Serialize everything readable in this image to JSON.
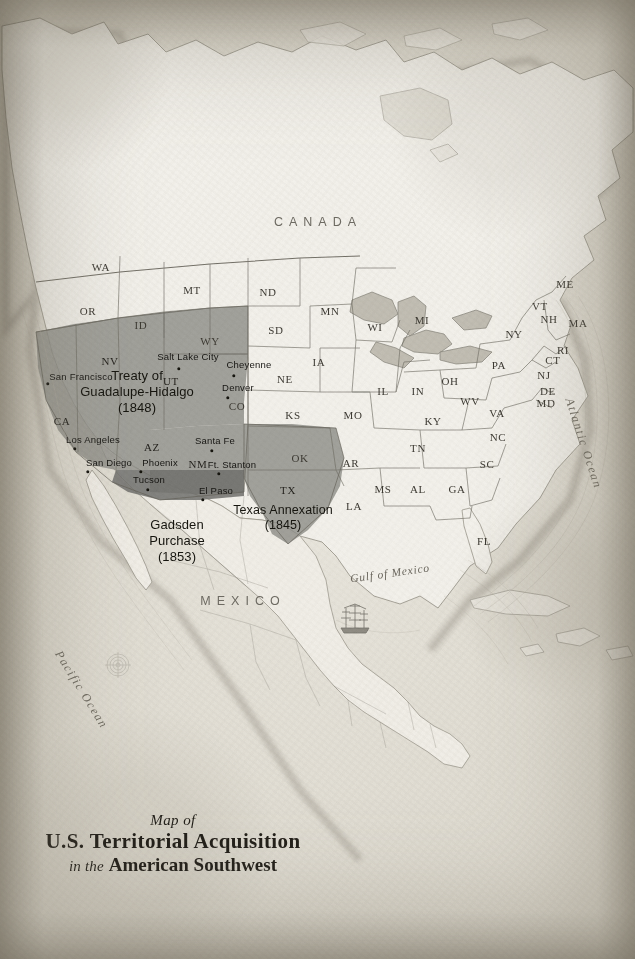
{
  "document": {
    "type": "antique-map",
    "title_prefix": "Map of",
    "title_main": "U.S. Territorial Acquisition",
    "subtitle_italic_1": "in the",
    "subtitle_bold": "American Southwest"
  },
  "palette": {
    "paper": "#ece9e2",
    "paper_dark": "#cdc8bb",
    "land": "#f3f1ea",
    "water": "#e6e3da",
    "shaded_territory": "#8d8d88",
    "gadsden_dark": "#6f6f6b",
    "border": "#6a675e",
    "coast": "#9b978c",
    "ink": "#16150f"
  },
  "countries": [
    {
      "name": "CANADA",
      "x": 318,
      "y": 222
    },
    {
      "name": "MEXICO",
      "x": 243,
      "y": 601
    }
  ],
  "oceans": [
    {
      "name": "Pacific Ocean",
      "x": 64,
      "y": 648,
      "rotate": 58
    },
    {
      "name": "Atlantic Ocean",
      "x": 576,
      "y": 396,
      "rotate": 72
    }
  ],
  "seas": [
    {
      "name": "Gulf of Mexico",
      "x": 390,
      "y": 573
    }
  ],
  "territories": [
    {
      "id": "treaty-guadalupe-hidalgo",
      "lines": [
        "Treaty of",
        "Guadalupe-Hidalgo",
        "(1848)"
      ],
      "x": 137,
      "y": 392,
      "fill": "#8d8d88",
      "year": "1848"
    },
    {
      "id": "gadsden-purchase",
      "lines": [
        "Gadsden",
        "Purchase",
        "(1853)"
      ],
      "x": 177,
      "y": 541,
      "fill": "#6f6f6b",
      "year": "1853"
    },
    {
      "id": "texas-annexation",
      "lines": [
        "Texas Annexation",
        "(1845)"
      ],
      "x": 283,
      "y": 518,
      "fill": "#8d8d88",
      "year": "1845"
    }
  ],
  "cities": [
    {
      "name": "San Francisco",
      "lx": 81,
      "ly": 376,
      "dx": 48,
      "dy": 384
    },
    {
      "name": "Salt Lake City",
      "lx": 188,
      "ly": 356,
      "dx": 179,
      "dy": 369
    },
    {
      "name": "Cheyenne",
      "lx": 249,
      "ly": 364,
      "dx": 234,
      "dy": 376
    },
    {
      "name": "Denver",
      "lx": 238,
      "ly": 387,
      "dx": 228,
      "dy": 398
    },
    {
      "name": "Los Angeles",
      "lx": 93,
      "ly": 439,
      "dx": 75,
      "dy": 449
    },
    {
      "name": "San Diego",
      "lx": 109,
      "ly": 462,
      "dx": 88,
      "dy": 472
    },
    {
      "name": "Phoenix",
      "lx": 160,
      "ly": 462,
      "dx": 141,
      "dy": 472
    },
    {
      "name": "Tucson",
      "lx": 149,
      "ly": 479,
      "dx": 148,
      "dy": 490
    },
    {
      "name": "Santa Fe",
      "lx": 215,
      "ly": 440,
      "dx": 212,
      "dy": 451
    },
    {
      "name": "Ft. Stanton",
      "lx": 232,
      "ly": 464,
      "dx": 219,
      "dy": 474
    },
    {
      "name": "El Paso",
      "lx": 216,
      "ly": 490,
      "dx": 203,
      "dy": 500
    }
  ],
  "states": [
    {
      "abbr": "WA",
      "x": 101,
      "y": 267,
      "shaded": false
    },
    {
      "abbr": "OR",
      "x": 88,
      "y": 311,
      "shaded": false
    },
    {
      "abbr": "ID",
      "x": 141,
      "y": 325,
      "shaded": false
    },
    {
      "abbr": "MT",
      "x": 192,
      "y": 290,
      "shaded": false
    },
    {
      "abbr": "ND",
      "x": 268,
      "y": 292,
      "shaded": false
    },
    {
      "abbr": "SD",
      "x": 276,
      "y": 330,
      "shaded": false
    },
    {
      "abbr": "WY",
      "x": 210,
      "y": 341,
      "shaded": false
    },
    {
      "abbr": "MN",
      "x": 330,
      "y": 311,
      "shaded": false
    },
    {
      "abbr": "WI",
      "x": 375,
      "y": 327,
      "shaded": false
    },
    {
      "abbr": "IA",
      "x": 319,
      "y": 362,
      "shaded": false
    },
    {
      "abbr": "NE",
      "x": 285,
      "y": 379,
      "shaded": false
    },
    {
      "abbr": "MI",
      "x": 422,
      "y": 320,
      "shaded": false
    },
    {
      "abbr": "IL",
      "x": 383,
      "y": 391,
      "shaded": false
    },
    {
      "abbr": "IN",
      "x": 418,
      "y": 391,
      "shaded": false
    },
    {
      "abbr": "OH",
      "x": 450,
      "y": 381,
      "shaded": false
    },
    {
      "abbr": "PA",
      "x": 499,
      "y": 365,
      "shaded": false
    },
    {
      "abbr": "NY",
      "x": 514,
      "y": 334,
      "shaded": false
    },
    {
      "abbr": "VT",
      "x": 540,
      "y": 306,
      "shaded": false
    },
    {
      "abbr": "NH",
      "x": 549,
      "y": 319,
      "shaded": false
    },
    {
      "abbr": "ME",
      "x": 565,
      "y": 284,
      "shaded": false
    },
    {
      "abbr": "MA",
      "x": 578,
      "y": 323,
      "shaded": false
    },
    {
      "abbr": "RI",
      "x": 563,
      "y": 350,
      "shaded": false
    },
    {
      "abbr": "CT",
      "x": 553,
      "y": 360,
      "shaded": false
    },
    {
      "abbr": "NJ",
      "x": 544,
      "y": 375,
      "shaded": false
    },
    {
      "abbr": "DE",
      "x": 548,
      "y": 391,
      "shaded": false
    },
    {
      "abbr": "MD",
      "x": 546,
      "y": 403,
      "shaded": false
    },
    {
      "abbr": "WV",
      "x": 470,
      "y": 401,
      "shaded": false
    },
    {
      "abbr": "VA",
      "x": 497,
      "y": 413,
      "shaded": false
    },
    {
      "abbr": "KY",
      "x": 433,
      "y": 421,
      "shaded": false
    },
    {
      "abbr": "MO",
      "x": 353,
      "y": 415,
      "shaded": false
    },
    {
      "abbr": "KS",
      "x": 293,
      "y": 415,
      "shaded": false
    },
    {
      "abbr": "CO",
      "x": 237,
      "y": 406,
      "shaded": false
    },
    {
      "abbr": "UT",
      "x": 171,
      "y": 381,
      "shaded": true
    },
    {
      "abbr": "NV",
      "x": 110,
      "y": 361,
      "shaded": true
    },
    {
      "abbr": "CA",
      "x": 62,
      "y": 421,
      "shaded": true
    },
    {
      "abbr": "AZ",
      "x": 152,
      "y": 447,
      "shaded": true
    },
    {
      "abbr": "NM",
      "x": 198,
      "y": 464,
      "shaded": true
    },
    {
      "abbr": "TN",
      "x": 418,
      "y": 448,
      "shaded": false
    },
    {
      "abbr": "NC",
      "x": 498,
      "y": 437,
      "shaded": false
    },
    {
      "abbr": "SC",
      "x": 487,
      "y": 464,
      "shaded": false
    },
    {
      "abbr": "OK",
      "x": 300,
      "y": 458,
      "shaded": false
    },
    {
      "abbr": "AR",
      "x": 351,
      "y": 463,
      "shaded": false
    },
    {
      "abbr": "TX",
      "x": 288,
      "y": 490,
      "shaded": true
    },
    {
      "abbr": "MS",
      "x": 383,
      "y": 489,
      "shaded": false
    },
    {
      "abbr": "AL",
      "x": 418,
      "y": 489,
      "shaded": false
    },
    {
      "abbr": "GA",
      "x": 457,
      "y": 489,
      "shaded": false
    },
    {
      "abbr": "LA",
      "x": 354,
      "y": 506,
      "shaded": false
    },
    {
      "abbr": "FL",
      "x": 484,
      "y": 541,
      "shaded": false
    }
  ],
  "decorations": [
    {
      "name": "sailing-ship",
      "x": 355,
      "y": 622
    },
    {
      "name": "compass-rose",
      "x": 118,
      "y": 665
    }
  ]
}
